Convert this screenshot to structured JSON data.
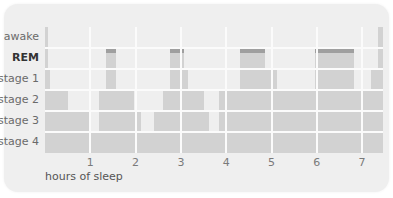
{
  "chart_data": {
    "type": "hypnogram",
    "title": "",
    "xlabel": "hours of sleep",
    "ylabel": "",
    "x_ticks": [
      1,
      2,
      3,
      4,
      5,
      6,
      7
    ],
    "x_range": [
      0,
      7.45
    ],
    "stages": [
      "awake",
      "REM",
      "stage 1",
      "stage 2",
      "stage 3",
      "stage 4"
    ],
    "highlighted_stage": "REM",
    "grid": true,
    "segments": [
      {
        "start": 0.0,
        "end": 0.05,
        "stage": "awake"
      },
      {
        "start": 0.05,
        "end": 0.1,
        "stage": "stage 1"
      },
      {
        "start": 0.1,
        "end": 0.5,
        "stage": "stage 2"
      },
      {
        "start": 0.5,
        "end": 0.95,
        "stage": "stage 3"
      },
      {
        "start": 0.95,
        "end": 1.2,
        "stage": "stage 4"
      },
      {
        "start": 1.2,
        "end": 1.35,
        "stage": "stage 2"
      },
      {
        "start": 1.35,
        "end": 1.55,
        "stage": "REM"
      },
      {
        "start": 1.55,
        "end": 1.95,
        "stage": "stage 2"
      },
      {
        "start": 1.95,
        "end": 2.1,
        "stage": "stage 3"
      },
      {
        "start": 2.1,
        "end": 2.4,
        "stage": "stage 4"
      },
      {
        "start": 2.4,
        "end": 2.6,
        "stage": "stage 3"
      },
      {
        "start": 2.6,
        "end": 2.75,
        "stage": "stage 2"
      },
      {
        "start": 2.75,
        "end": 3.05,
        "stage": "REM"
      },
      {
        "start": 3.05,
        "end": 3.15,
        "stage": "stage 1"
      },
      {
        "start": 3.15,
        "end": 3.5,
        "stage": "stage 2"
      },
      {
        "start": 3.5,
        "end": 3.6,
        "stage": "stage 3"
      },
      {
        "start": 3.6,
        "end": 3.85,
        "stage": "stage 4"
      },
      {
        "start": 3.85,
        "end": 4.3,
        "stage": "stage 2"
      },
      {
        "start": 4.3,
        "end": 4.85,
        "stage": "REM"
      },
      {
        "start": 4.85,
        "end": 5.1,
        "stage": "stage 1"
      },
      {
        "start": 5.1,
        "end": 5.95,
        "stage": "stage 2"
      },
      {
        "start": 5.95,
        "end": 6.8,
        "stage": "REM"
      },
      {
        "start": 6.8,
        "end": 7.2,
        "stage": "stage 2"
      },
      {
        "start": 7.2,
        "end": 7.35,
        "stage": "stage 1"
      },
      {
        "start": 7.35,
        "end": 7.45,
        "stage": "awake"
      }
    ]
  },
  "colors": {
    "card": "#efefef",
    "bar": "#d2d2d2",
    "rem_cap": "#9f9f9f",
    "grid": "#fbfbfb"
  },
  "labels": {
    "awake": "awake",
    "rem": "REM",
    "stage1": "stage 1",
    "stage2": "stage 2",
    "stage3": "stage 3",
    "stage4": "stage 4",
    "xlabel": "hours of sleep",
    "ticks": [
      "1",
      "2",
      "3",
      "4",
      "5",
      "6",
      "7"
    ]
  }
}
